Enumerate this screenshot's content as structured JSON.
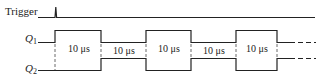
{
  "signals": {
    "trigger": {
      "label": "Trigger"
    },
    "q1": {
      "label": "Q",
      "subscript": "1"
    },
    "q2": {
      "label": "Q",
      "subscript": "2"
    }
  },
  "durations": [
    {
      "label": "10 μs"
    },
    {
      "label": "10 μs"
    },
    {
      "label": "10 μs"
    },
    {
      "label": "10 μs"
    },
    {
      "label": "10 μs"
    }
  ],
  "colors": {
    "line": "#222222",
    "background": "#ffffff"
  }
}
